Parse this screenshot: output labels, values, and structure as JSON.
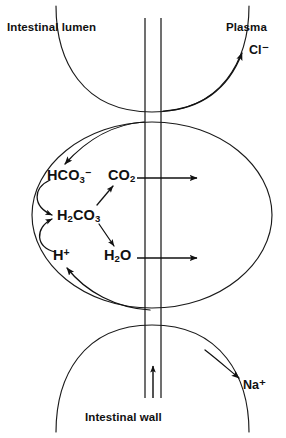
{
  "diagram": {
    "regions": {
      "lumen_label": "Intestinal lumen",
      "plasma_label": "Plasma",
      "wall_label": "Intestinal wall"
    },
    "transported_ions": [
      {
        "name": "chloride",
        "label_html": "Cl⁻",
        "direction": "into-plasma"
      },
      {
        "name": "sodium",
        "label_html": "Na⁺",
        "direction": "into-plasma"
      }
    ],
    "species": [
      {
        "name": "bicarbonate",
        "formula": "HCO3-",
        "label_html": "HCO<sub>3</sub><sup>−</sup>"
      },
      {
        "name": "carbonic-acid",
        "formula": "H2CO3",
        "label_html": "H<sub>2</sub>CO<sub>3</sub>"
      },
      {
        "name": "proton",
        "formula": "H+",
        "label_html": "H<sup>+</sup>"
      },
      {
        "name": "carbon-dioxide",
        "formula": "CO2",
        "label_html": "CO<sub>2</sub>"
      },
      {
        "name": "water",
        "formula": "H2O",
        "label_html": "H<sub>2</sub>O"
      }
    ],
    "reactions": [
      {
        "from": "bicarbonate",
        "to": "carbonic-acid",
        "style": "curved"
      },
      {
        "from": "proton",
        "to": "carbonic-acid",
        "style": "curved"
      },
      {
        "from": "carbonic-acid",
        "to": "carbon-dioxide",
        "style": "diagonal"
      },
      {
        "from": "carbonic-acid",
        "to": "water",
        "style": "diagonal"
      }
    ],
    "transport_arrows": [
      {
        "name": "co2-efflux",
        "species": "carbon-dioxide",
        "direction": "right"
      },
      {
        "name": "h2o-efflux",
        "species": "water",
        "direction": "right"
      },
      {
        "name": "chloride-uptake",
        "species": "chloride",
        "direction": "up-right"
      },
      {
        "name": "bicarbonate-entry",
        "species": "bicarbonate",
        "direction": "down-left"
      },
      {
        "name": "proton-entry",
        "species": "proton",
        "direction": "up-left"
      },
      {
        "name": "sodium-efflux",
        "species": "sodium",
        "direction": "down-right"
      },
      {
        "name": "wall-flow",
        "species": "",
        "direction": "up"
      }
    ],
    "colors": {
      "ink": "#111111",
      "background": "#ffffff"
    }
  }
}
